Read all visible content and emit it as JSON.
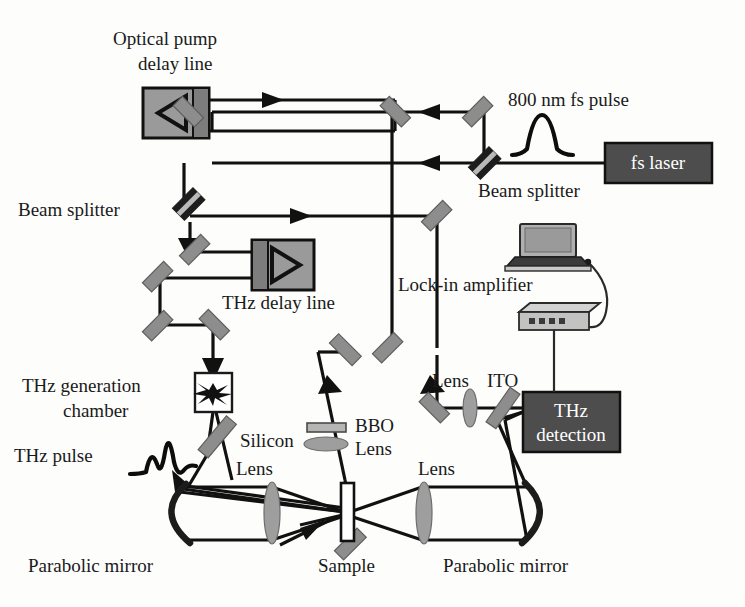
{
  "figure": {
    "type": "optical-schematic",
    "background_color": "#fdfdfb",
    "ink_color": "#111111"
  },
  "palette": {
    "beam_black": "#111111",
    "mirror_gray": "#8d8d8d",
    "delay_line_gray": "#9a9a9a",
    "instrument_dark": "#4d4d4d",
    "lens_gray": "#9e9e9e",
    "box_white": "#ffffff"
  },
  "labels": {
    "optical_pump_delay_line_1": "Optical pump",
    "optical_pump_delay_line_2": "delay line",
    "pulse_800nm": "800 nm fs pulse",
    "fs_laser": "fs laser",
    "beam_splitter_right": "Beam splitter",
    "beam_splitter_left": "Beam splitter",
    "thz_delay_line": "THz delay line",
    "lock_in_amplifier": "Lock-in amplifier",
    "thz_generation_1": "THz generation",
    "thz_generation_2": "chamber",
    "thz_pulse": "THz pulse",
    "silicon": "Silicon",
    "bbo": "BBO",
    "bbo_lens": "Lens",
    "lens_left": "Lens",
    "lens_center": "Lens",
    "lens_right_upper": "Lens",
    "ito": "ITO",
    "thz_detection_1": "THz",
    "thz_detection_2": "detection",
    "parabolic_mirror_left": "Parabolic mirror",
    "parabolic_mirror_right": "Parabolic mirror",
    "sample": "Sample"
  },
  "components": [
    {
      "id": "fs-laser",
      "name": "fs laser",
      "kind": "source-box",
      "fill": "#4d4d4d"
    },
    {
      "id": "optical-pump-delay-line",
      "name": "Optical pump delay line",
      "kind": "retroreflector-stage",
      "fill": "#9a9a9a"
    },
    {
      "id": "thz-delay-line",
      "name": "THz delay line",
      "kind": "retroreflector-stage",
      "fill": "#9a9a9a"
    },
    {
      "id": "thz-generation-chamber",
      "name": "THz generation chamber",
      "kind": "plasma-chamber",
      "fill": "#ffffff"
    },
    {
      "id": "thz-detection",
      "name": "THz detection",
      "kind": "detector-box",
      "fill": "#4d4d4d"
    },
    {
      "id": "lock-in-amplifier",
      "name": "Lock-in amplifier",
      "kind": "rack-instrument",
      "fill": "#bdbdbd"
    },
    {
      "id": "laptop",
      "name": "Computer",
      "kind": "laptop",
      "fill": "#9a9a9a"
    },
    {
      "id": "sample",
      "name": "Sample",
      "kind": "slab",
      "fill": "#ffffff"
    },
    {
      "id": "bbo",
      "name": "BBO crystal",
      "kind": "crystal",
      "fill": "#b5b5b5"
    },
    {
      "id": "silicon",
      "name": "Silicon wafer",
      "kind": "beam-combiner",
      "fill": "#8d8d8d"
    },
    {
      "id": "ito",
      "name": "ITO",
      "kind": "beam-combiner",
      "fill": "#8d8d8d"
    },
    {
      "id": "parabolic-mirror-left",
      "name": "Parabolic mirror (left)",
      "kind": "parabolic-mirror"
    },
    {
      "id": "parabolic-mirror-right",
      "name": "Parabolic mirror (right)",
      "kind": "parabolic-mirror"
    }
  ],
  "beam_legend": {
    "pulse_800nm": "800 nm fs pulse",
    "thz_pulse": "THz pulse"
  }
}
